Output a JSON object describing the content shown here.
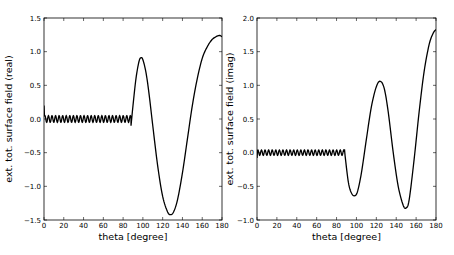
{
  "chart_data": [
    {
      "type": "line",
      "title": "",
      "xlabel": "theta [degree]",
      "ylabel": "ext. tot. surface field (real)",
      "xlim": [
        0,
        180
      ],
      "ylim": [
        -1.5,
        1.5
      ],
      "xticks": [
        "0",
        "20",
        "40",
        "60",
        "80",
        "100",
        "120",
        "140",
        "160",
        "180"
      ],
      "yticks": [
        "1.5",
        "1.0",
        "0.5",
        "0.0",
        "−0.5",
        "−1.0",
        "−1.5"
      ],
      "grid": false,
      "legend": null,
      "line_color": "#000000",
      "series": [
        {
          "name": "real",
          "x": [
            0,
            1,
            3,
            10,
            20,
            30,
            40,
            50,
            60,
            70,
            80,
            87,
            88,
            90,
            93,
            96,
            98,
            100,
            103,
            106,
            110,
            115,
            120,
            125,
            128,
            131,
            135,
            140,
            145,
            150,
            155,
            160,
            165,
            170,
            175,
            178,
            180
          ],
          "y": [
            0.2,
            0.0,
            -0.07,
            0.0,
            0.0,
            0.0,
            0.0,
            0.0,
            0.0,
            0.0,
            0.0,
            0.0,
            -0.1,
            0.2,
            0.6,
            0.85,
            0.91,
            0.88,
            0.7,
            0.4,
            -0.1,
            -0.7,
            -1.15,
            -1.38,
            -1.42,
            -1.38,
            -1.2,
            -0.8,
            -0.3,
            0.2,
            0.6,
            0.9,
            1.07,
            1.18,
            1.23,
            1.24,
            1.22
          ],
          "note": "small oscillation (~±0.05) around 0 for theta 0–88"
        }
      ]
    },
    {
      "type": "line",
      "title": "",
      "xlabel": "theta [degree]",
      "ylabel": "ext. tot. surface field (imag)",
      "xlim": [
        0,
        180
      ],
      "ylim": [
        -1.0,
        2.0
      ],
      "xticks": [
        "0",
        "20",
        "40",
        "60",
        "80",
        "100",
        "120",
        "140",
        "160",
        "180"
      ],
      "yticks": [
        "2.0",
        "1.5",
        "1.0",
        "0.5",
        "0.0",
        "−0.5",
        "−1.0"
      ],
      "grid": false,
      "legend": null,
      "line_color": "#000000",
      "series": [
        {
          "name": "imag",
          "x": [
            0,
            1,
            10,
            20,
            30,
            40,
            50,
            60,
            70,
            80,
            88,
            89,
            92,
            95,
            98,
            101,
            105,
            110,
            115,
            120,
            124,
            128,
            132,
            137,
            142,
            147,
            150,
            153,
            158,
            163,
            168,
            173,
            177,
            180
          ],
          "y": [
            -0.08,
            0.03,
            0.0,
            0.0,
            0.0,
            0.0,
            0.0,
            0.0,
            0.0,
            0.0,
            0.05,
            -0.1,
            -0.45,
            -0.6,
            -0.64,
            -0.58,
            -0.3,
            0.2,
            0.68,
            0.98,
            1.06,
            0.95,
            0.6,
            0.0,
            -0.5,
            -0.78,
            -0.82,
            -0.7,
            -0.1,
            0.6,
            1.2,
            1.6,
            1.77,
            1.83
          ],
          "note": "small oscillation (~±0.04) around 0 for theta 0–88"
        }
      ]
    }
  ]
}
